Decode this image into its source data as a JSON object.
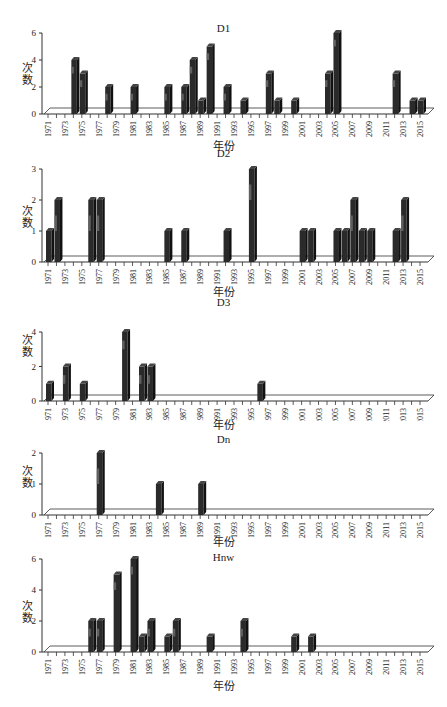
{
  "years": [
    "1971",
    "1972",
    "1973",
    "1974",
    "1975",
    "1976",
    "1977",
    "1978",
    "1979",
    "1980",
    "1981",
    "1982",
    "1983",
    "1984",
    "1985",
    "1986",
    "1987",
    "1988",
    "1989",
    "1990",
    "1991",
    "1992",
    "1993",
    "1994",
    "1995",
    "1996",
    "1997",
    "1998",
    "1999",
    "2000",
    "2001",
    "2002",
    "2003",
    "2004",
    "2005",
    "2006",
    "2007",
    "2008",
    "2009",
    "2010",
    "2011",
    "2012",
    "2013",
    "2014",
    "2015"
  ],
  "tick_labels": [
    "1971",
    "1973",
    "1975",
    "1977",
    "1979",
    "1981",
    "1983",
    "1985",
    "1987",
    "1989",
    "1991",
    "1993",
    "1995",
    "1997",
    "1999",
    "2001",
    "2003",
    "2005",
    "2007",
    "2009",
    "2011",
    "2013",
    "2015"
  ],
  "colors": {
    "bar_dark": "#2a2a2a",
    "bar_mid": "#6e6e6e",
    "axis": "#333333",
    "background": "#ffffff"
  },
  "chart_data": [
    {
      "type": "bar",
      "title": "D1",
      "xlabel": "年份",
      "ylabel": "次数",
      "ylim": [
        0,
        6
      ],
      "yticks": [
        0,
        2,
        4,
        6
      ],
      "grid": false,
      "style": "3d-column",
      "categories": [
        "1971",
        "1972",
        "1973",
        "1974",
        "1975",
        "1976",
        "1977",
        "1978",
        "1979",
        "1980",
        "1981",
        "1982",
        "1983",
        "1984",
        "1985",
        "1986",
        "1987",
        "1988",
        "1989",
        "1990",
        "1991",
        "1992",
        "1993",
        "1994",
        "1995",
        "1996",
        "1997",
        "1998",
        "1999",
        "2000",
        "2001",
        "2002",
        "2003",
        "2004",
        "2005",
        "2006",
        "2007",
        "2008",
        "2009",
        "2010",
        "2011",
        "2012",
        "2013",
        "2014",
        "2015"
      ],
      "values": [
        0,
        0,
        0,
        4,
        3,
        0,
        0,
        2,
        0,
        0,
        2,
        0,
        0,
        0,
        2,
        0,
        2,
        4,
        1,
        5,
        0,
        2,
        0,
        1,
        0,
        0,
        3,
        1,
        0,
        1,
        0,
        0,
        0,
        3,
        6,
        0,
        0,
        0,
        0,
        0,
        0,
        3,
        0,
        1,
        1
      ]
    },
    {
      "type": "bar",
      "title": "D2",
      "xlabel": "年份",
      "ylabel": "次数",
      "ylim": [
        0,
        3
      ],
      "yticks": [
        0,
        1,
        2,
        3
      ],
      "grid": false,
      "style": "3d-column",
      "categories": [
        "1971",
        "1972",
        "1973",
        "1974",
        "1975",
        "1976",
        "1977",
        "1978",
        "1979",
        "1980",
        "1981",
        "1982",
        "1983",
        "1984",
        "1985",
        "1986",
        "1987",
        "1988",
        "1989",
        "1990",
        "1991",
        "1992",
        "1993",
        "1994",
        "1995",
        "1996",
        "1997",
        "1998",
        "1999",
        "2000",
        "2001",
        "2002",
        "2003",
        "2004",
        "2005",
        "2006",
        "2007",
        "2008",
        "2009",
        "2010",
        "2011",
        "2012",
        "2013",
        "2014",
        "2015"
      ],
      "values": [
        1,
        2,
        0,
        0,
        0,
        2,
        2,
        0,
        0,
        0,
        0,
        0,
        0,
        0,
        1,
        0,
        1,
        0,
        0,
        0,
        0,
        1,
        0,
        0,
        3,
        0,
        0,
        0,
        0,
        0,
        1,
        1,
        0,
        0,
        1,
        1,
        2,
        1,
        1,
        0,
        0,
        1,
        2,
        0,
        0
      ]
    },
    {
      "type": "bar",
      "title": "D3",
      "xlabel": "年份",
      "ylabel": "次数",
      "ylim": [
        0,
        4
      ],
      "yticks": [
        0,
        2,
        4
      ],
      "grid": false,
      "style": "3d-column",
      "categories": [
        "1971",
        "1972",
        "1973",
        "1974",
        "1975",
        "1976",
        "1977",
        "1978",
        "1979",
        "1980",
        "1981",
        "1982",
        "1983",
        "1984",
        "1985",
        "1986",
        "1987",
        "1988",
        "1989",
        "1990",
        "1991",
        "1992",
        "1993",
        "1994",
        "1995",
        "1996",
        "1997",
        "1998",
        "1999",
        "2000",
        "2001",
        "2002",
        "2003",
        "2004",
        "2005",
        "2006",
        "2007",
        "2008",
        "2009",
        "2010",
        "2011",
        "2012",
        "2013",
        "2014",
        "2015"
      ],
      "values": [
        1,
        0,
        2,
        0,
        1,
        0,
        0,
        0,
        0,
        4,
        0,
        2,
        2,
        0,
        0,
        0,
        0,
        0,
        0,
        0,
        0,
        0,
        0,
        0,
        0,
        1,
        0,
        0,
        0,
        0,
        0,
        0,
        0,
        0,
        0,
        0,
        0,
        0,
        0,
        0,
        0,
        0,
        0,
        0,
        0
      ]
    },
    {
      "type": "bar",
      "title": "Dn",
      "xlabel": "年份",
      "ylabel": "次数",
      "ylim": [
        0,
        2
      ],
      "yticks": [
        0,
        1,
        2
      ],
      "grid": false,
      "style": "3d-column",
      "categories": [
        "1971",
        "1972",
        "1973",
        "1974",
        "1975",
        "1976",
        "1977",
        "1978",
        "1979",
        "1980",
        "1981",
        "1982",
        "1983",
        "1984",
        "1985",
        "1986",
        "1987",
        "1988",
        "1989",
        "1990",
        "1991",
        "1992",
        "1993",
        "1994",
        "1995",
        "1996",
        "1997",
        "1998",
        "1999",
        "2000",
        "2001",
        "2002",
        "2003",
        "2004",
        "2005",
        "2006",
        "2007",
        "2008",
        "2009",
        "2010",
        "2011",
        "2012",
        "2013",
        "2014",
        "2015"
      ],
      "values": [
        0,
        0,
        0,
        0,
        0,
        0,
        2,
        0,
        0,
        0,
        0,
        0,
        0,
        1,
        0,
        0,
        0,
        0,
        1,
        0,
        0,
        0,
        0,
        0,
        0,
        0,
        0,
        0,
        0,
        0,
        0,
        0,
        0,
        0,
        0,
        0,
        0,
        0,
        0,
        0,
        0,
        0,
        0,
        0,
        0
      ]
    },
    {
      "type": "bar",
      "title": "Hnw",
      "xlabel": "年份",
      "ylabel": "次数",
      "ylim": [
        0,
        6
      ],
      "yticks": [
        0,
        2,
        4,
        6
      ],
      "grid": false,
      "style": "3d-column",
      "categories": [
        "1971",
        "1972",
        "1973",
        "1974",
        "1975",
        "1976",
        "1977",
        "1978",
        "1979",
        "1980",
        "1981",
        "1982",
        "1983",
        "1984",
        "1985",
        "1986",
        "1987",
        "1988",
        "1989",
        "1990",
        "1991",
        "1992",
        "1993",
        "1994",
        "1995",
        "1996",
        "1997",
        "1998",
        "1999",
        "2000",
        "2001",
        "2002",
        "2003",
        "2004",
        "2005",
        "2006",
        "2007",
        "2008",
        "2009",
        "2010",
        "2011",
        "2012",
        "2013",
        "2014",
        "2015"
      ],
      "values": [
        0,
        0,
        0,
        0,
        0,
        2,
        2,
        0,
        5,
        0,
        6,
        1,
        2,
        0,
        1,
        2,
        0,
        0,
        0,
        1,
        0,
        0,
        0,
        2,
        0,
        0,
        0,
        0,
        0,
        1,
        0,
        1,
        0,
        0,
        0,
        0,
        0,
        0,
        0,
        0,
        0,
        0,
        0,
        0,
        0
      ]
    }
  ],
  "panels": [
    {
      "title": "D1",
      "ylabel": "次数",
      "xlabel": "年份"
    },
    {
      "title": "D2",
      "ylabel": "次数",
      "xlabel": "年份"
    },
    {
      "title": "D3",
      "ylabel": "次数",
      "xlabel": "年份"
    },
    {
      "title": "Dn",
      "ylabel": "次数",
      "xlabel": "年份"
    },
    {
      "title": "Hnw",
      "ylabel": "次数",
      "xlabel": "年份"
    }
  ]
}
